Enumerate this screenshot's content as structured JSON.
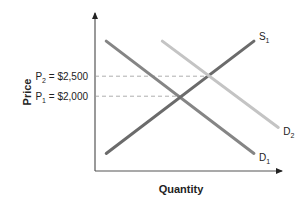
{
  "chart_data": {
    "type": "line",
    "title": "",
    "xlabel": "Quantity",
    "ylabel": "Price",
    "xlim": [
      0,
      10
    ],
    "ylim": [
      0,
      4500
    ],
    "grid": false,
    "series": [
      {
        "name": "D1",
        "label_main": "D",
        "label_sub": "1",
        "color": "#858585",
        "points": [
          [
            0.6,
            3700
          ],
          [
            8.5,
            500
          ]
        ]
      },
      {
        "name": "S1",
        "label_main": "S",
        "label_sub": "1",
        "color": "#6b6b6b",
        "points": [
          [
            0.6,
            500
          ],
          [
            8.5,
            3700
          ]
        ]
      },
      {
        "name": "D2",
        "label_main": "D",
        "label_sub": "2",
        "color": "#c4c4c4",
        "points": [
          [
            3.6,
            3700
          ],
          [
            9.8,
            1240
          ]
        ]
      }
    ],
    "reference_lines": [
      {
        "label_main": "P",
        "label_sub": "2",
        "label_rest": " = $2,500",
        "y": 2700,
        "x_end": 6.0
      },
      {
        "label_main": "P",
        "label_sub": "1",
        "label_rest": " = $2,000",
        "y": 2130,
        "x_end": 4.5
      }
    ]
  }
}
